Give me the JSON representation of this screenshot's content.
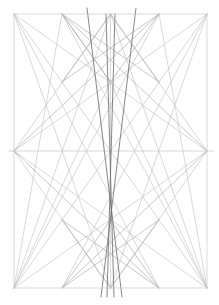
{
  "document": {
    "title": "Geometric Line Construction",
    "kind": "line-diagram",
    "background_color": "#ffffff",
    "width": 219,
    "height": 305
  },
  "palette": {
    "frame_color": "#c9c9c9",
    "light_line_color": "#b9b9b9",
    "medium_line_color": "#a8a8a8",
    "dark_line_color": "#6e6e6e",
    "background": "#ffffff"
  },
  "geometry": {
    "frame": {
      "left": 14,
      "right": 207,
      "top": 14,
      "bottom": 288,
      "width": 193,
      "height": 274
    },
    "anchors": {
      "top_left": [
        14,
        14
      ],
      "top_right": [
        207,
        14
      ],
      "bottom_left": [
        14,
        288
      ],
      "bottom_right": [
        207,
        288
      ],
      "top_mid": [
        110.5,
        14
      ],
      "bottom_mid": [
        110.5,
        288
      ],
      "left_mid": [
        14,
        151
      ],
      "right_mid": [
        207,
        151
      ],
      "center": [
        110.5,
        151
      ],
      "top_quarter_left": [
        62,
        14
      ],
      "top_quarter_right": [
        159,
        14
      ],
      "bottom_quarter_left": [
        62,
        288
      ],
      "bottom_quarter_right": [
        159,
        288
      ],
      "upper_node": [
        110.5,
        82
      ],
      "lower_node": [
        110.5,
        220
      ],
      "left_upper_node": [
        62,
        82
      ],
      "right_upper_node": [
        159,
        82
      ],
      "left_lower_node": [
        62,
        220
      ],
      "right_lower_node": [
        159,
        220
      ]
    },
    "guides": {
      "horizontal_midline_y": 151,
      "vertical_centerline_x": 110.5,
      "right_tick_end_x": 214,
      "left_tick_end_x": 9,
      "dark_overshoot_bottom_y": 297,
      "dark_overshoot_top_y": 8
    }
  },
  "layers": {
    "frame": {
      "name": "Frame Rectangle",
      "stroke": "#c9c9c9",
      "stroke_width": 0.7
    },
    "light": {
      "name": "Light Construction Lines",
      "stroke": "#bdbdbd",
      "stroke_width": 0.6
    },
    "medium": {
      "name": "Medium Construction Lines",
      "stroke": "#aaaaaa",
      "stroke_width": 0.65
    },
    "dark": {
      "name": "Emphasis Lines",
      "stroke": "#707070",
      "stroke_width": 0.85
    }
  },
  "lines": {
    "frame": [
      {
        "id": "frame-top",
        "x1": 14,
        "y1": 14,
        "x2": 207,
        "y2": 14
      },
      {
        "id": "frame-right",
        "x1": 207,
        "y1": 14,
        "x2": 207,
        "y2": 288
      },
      {
        "id": "frame-bottom",
        "x1": 14,
        "y1": 288,
        "x2": 207,
        "y2": 288
      },
      {
        "id": "frame-left",
        "x1": 14,
        "y1": 14,
        "x2": 14,
        "y2": 288
      }
    ],
    "axes": [
      {
        "id": "horizontal-midline",
        "x1": 9,
        "y1": 151,
        "x2": 214,
        "y2": 151
      },
      {
        "id": "vertical-centerline",
        "x1": 110.5,
        "y1": 14,
        "x2": 110.5,
        "y2": 288
      }
    ],
    "light": [
      {
        "id": "diag-tl-br",
        "x1": 14,
        "y1": 14,
        "x2": 207,
        "y2": 288
      },
      {
        "id": "diag-tr-bl",
        "x1": 207,
        "y1": 14,
        "x2": 14,
        "y2": 288
      },
      {
        "id": "tl-to-rightmid",
        "x1": 14,
        "y1": 14,
        "x2": 207,
        "y2": 151
      },
      {
        "id": "tr-to-leftmid",
        "x1": 207,
        "y1": 14,
        "x2": 14,
        "y2": 151
      },
      {
        "id": "bl-to-rightmid",
        "x1": 14,
        "y1": 288,
        "x2": 207,
        "y2": 151
      },
      {
        "id": "br-to-leftmid",
        "x1": 207,
        "y1": 288,
        "x2": 14,
        "y2": 151
      },
      {
        "id": "leftmid-to-topmid",
        "x1": 14,
        "y1": 151,
        "x2": 110.5,
        "y2": 14
      },
      {
        "id": "leftmid-to-botmid",
        "x1": 14,
        "y1": 151,
        "x2": 110.5,
        "y2": 288
      },
      {
        "id": "rightmid-to-topmid",
        "x1": 207,
        "y1": 151,
        "x2": 110.5,
        "y2": 14
      },
      {
        "id": "rightmid-to-botmid",
        "x1": 207,
        "y1": 151,
        "x2": 110.5,
        "y2": 288
      },
      {
        "id": "tl-to-botmid",
        "x1": 14,
        "y1": 14,
        "x2": 110.5,
        "y2": 288
      },
      {
        "id": "tr-to-botmid",
        "x1": 207,
        "y1": 14,
        "x2": 110.5,
        "y2": 288
      },
      {
        "id": "bl-to-topmid",
        "x1": 14,
        "y1": 288,
        "x2": 110.5,
        "y2": 14
      },
      {
        "id": "br-to-topmid",
        "x1": 207,
        "y1": 288,
        "x2": 110.5,
        "y2": 14
      },
      {
        "id": "tl-to-qbr",
        "x1": 14,
        "y1": 14,
        "x2": 159,
        "y2": 288
      },
      {
        "id": "tr-to-qbl",
        "x1": 207,
        "y1": 14,
        "x2": 62,
        "y2": 288
      },
      {
        "id": "bl-to-qtr",
        "x1": 14,
        "y1": 288,
        "x2": 159,
        "y2": 14
      },
      {
        "id": "br-to-qtl",
        "x1": 207,
        "y1": 288,
        "x2": 62,
        "y2": 14
      },
      {
        "id": "qtl-to-bl",
        "x1": 62,
        "y1": 14,
        "x2": 14,
        "y2": 288
      },
      {
        "id": "qtr-to-br",
        "x1": 159,
        "y1": 14,
        "x2": 207,
        "y2": 288
      },
      {
        "id": "upper-node-to-bl",
        "x1": 110.5,
        "y1": 82,
        "x2": 14,
        "y2": 288
      },
      {
        "id": "upper-node-to-br",
        "x1": 110.5,
        "y1": 82,
        "x2": 207,
        "y2": 288
      }
    ],
    "medium": [
      {
        "id": "qtl-to-uppernode",
        "x1": 62,
        "y1": 14,
        "x2": 110.5,
        "y2": 82
      },
      {
        "id": "qtr-to-uppernode",
        "x1": 159,
        "y1": 14,
        "x2": 110.5,
        "y2": 82
      },
      {
        "id": "uppernode-to-qtl-down",
        "x1": 110.5,
        "y1": 82,
        "x2": 62,
        "y2": 14
      },
      {
        "id": "bowtie-upper-left",
        "x1": 62,
        "y1": 14,
        "x2": 159,
        "y2": 82
      },
      {
        "id": "bowtie-upper-right",
        "x1": 159,
        "y1": 14,
        "x2": 62,
        "y2": 82
      },
      {
        "id": "upper-diamond-left",
        "x1": 62,
        "y1": 82,
        "x2": 110.5,
        "y2": 14
      },
      {
        "id": "upper-diamond-right",
        "x1": 159,
        "y1": 82,
        "x2": 110.5,
        "y2": 14
      },
      {
        "id": "lowernode-to-qbl",
        "x1": 110.5,
        "y1": 220,
        "x2": 62,
        "y2": 288
      },
      {
        "id": "lowernode-to-qbr",
        "x1": 110.5,
        "y1": 220,
        "x2": 159,
        "y2": 288
      },
      {
        "id": "bowtie-lower-left",
        "x1": 62,
        "y1": 288,
        "x2": 159,
        "y2": 220
      },
      {
        "id": "bowtie-lower-right",
        "x1": 159,
        "y1": 288,
        "x2": 62,
        "y2": 220
      },
      {
        "id": "lower-diamond-left",
        "x1": 62,
        "y1": 220,
        "x2": 110.5,
        "y2": 288
      },
      {
        "id": "lower-diamond-right",
        "x1": 159,
        "y1": 220,
        "x2": 110.5,
        "y2": 288
      },
      {
        "id": "leftmid-to-qtr",
        "x1": 14,
        "y1": 151,
        "x2": 159,
        "y2": 14
      },
      {
        "id": "rightmid-to-qtl",
        "x1": 207,
        "y1": 151,
        "x2": 62,
        "y2": 14
      },
      {
        "id": "leftmid-to-qbr",
        "x1": 14,
        "y1": 151,
        "x2": 159,
        "y2": 288
      },
      {
        "id": "rightmid-to-qbl",
        "x1": 207,
        "y1": 151,
        "x2": 62,
        "y2": 288
      }
    ],
    "dark": [
      {
        "id": "emphasis-left-steep",
        "x1": 87,
        "y1": 8,
        "x2": 122,
        "y2": 297
      },
      {
        "id": "emphasis-right-steep",
        "x1": 136,
        "y1": 8,
        "x2": 101,
        "y2": 297
      },
      {
        "id": "emphasis-inner-left",
        "x1": 106,
        "y1": 14,
        "x2": 114,
        "y2": 297
      },
      {
        "id": "emphasis-inner-right",
        "x1": 115,
        "y1": 14,
        "x2": 107,
        "y2": 297
      }
    ]
  },
  "nodes": [
    {
      "id": "node-center",
      "x": 110.5,
      "y": 151,
      "label": "center"
    },
    {
      "id": "node-upper",
      "x": 110.5,
      "y": 82,
      "label": "upper-convergence"
    },
    {
      "id": "node-lower",
      "x": 110.5,
      "y": 220,
      "label": "lower-convergence"
    },
    {
      "id": "node-left-mid",
      "x": 14,
      "y": 151,
      "label": "left-mid"
    },
    {
      "id": "node-right-mid",
      "x": 207,
      "y": 151,
      "label": "right-mid"
    }
  ]
}
